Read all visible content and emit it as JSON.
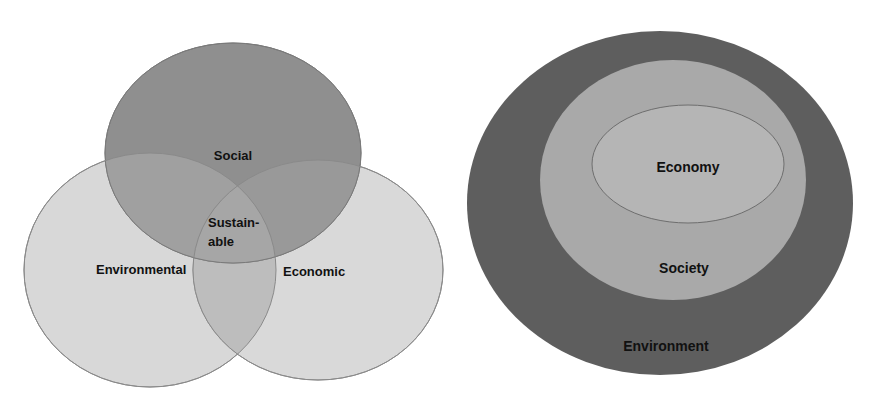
{
  "diagrams": {
    "venn": {
      "title": "Three-circle sustainability model",
      "circles": [
        {
          "id": "social",
          "label": "Social",
          "color": "#8f8f8f",
          "opacity": 1
        },
        {
          "id": "environmental",
          "label": "Environmental",
          "color": "#d8d8d8"
        },
        {
          "id": "economic",
          "label": "Economic",
          "color": "#d9d9d9"
        }
      ],
      "center_label_line1": "Sustain-",
      "center_label_line2": "able",
      "overlap_color": "#a3a3a3"
    },
    "nested": {
      "title": "Nested sustainability model",
      "layers": [
        {
          "id": "environment",
          "label": "Environment",
          "color": "#5e5e5e"
        },
        {
          "id": "society",
          "label": "Society",
          "color": "#a9a9a9"
        },
        {
          "id": "economy",
          "label": "Economy",
          "color": "#b5b5b5"
        }
      ]
    }
  }
}
